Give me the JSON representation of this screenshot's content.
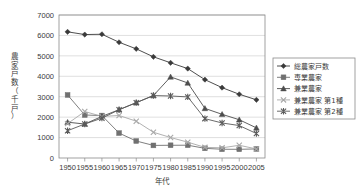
{
  "chart_data": {
    "type": "line",
    "title": "",
    "xlabel": "年代",
    "ylabel": "農家戸数（千戸）",
    "x": [
      1950,
      1955,
      1960,
      1965,
      1970,
      1975,
      1980,
      1985,
      1990,
      1995,
      2000,
      2005
    ],
    "xticklabels": [
      "1950",
      "1955",
      "1960",
      "1965",
      "1970",
      "1975",
      "1980",
      "1985",
      "1990",
      "1995",
      "2000",
      "2005"
    ],
    "yticklabels": [
      "0",
      "1000",
      "2000",
      "3000",
      "4000",
      "5000",
      "6000",
      "7000"
    ],
    "ylim": [
      0,
      7000
    ],
    "ytick_step": 1000,
    "grid": "horizontal",
    "legend_position": "right",
    "series": [
      {
        "name": "総農家戸数",
        "marker": "diamond",
        "color": "#3a3a3a",
        "values": [
          6176,
          6043,
          6057,
          5665,
          5342,
          4953,
          4661,
          4376,
          3835,
          3444,
          3120,
          2848
        ]
      },
      {
        "name": "専業農家",
        "marker": "square",
        "color": "#707070",
        "values": [
          3086,
          2105,
          2078,
          1219,
          831,
          616,
          623,
          626,
          473,
          428,
          426,
          443
        ]
      },
      {
        "name": "兼業農家",
        "marker": "triangle",
        "color": "#4d4d4d",
        "values": [
          1753,
          1663,
          2036,
          2365,
          2709,
          3057,
          3971,
          3674,
          2428,
          2139,
          1873,
          1475
        ]
      },
      {
        "name": "兼業農家 第1種",
        "marker": "cross",
        "color": "#a8a8a8",
        "values": [
          1683,
          2275,
          2036,
          2081,
          1802,
          1259,
          1002,
          775,
          521,
          498,
          623,
          443
        ]
      },
      {
        "name": "兼業農家 第2種",
        "marker": "star",
        "color": "#5a5a5a",
        "values": [
          1336,
          1663,
          1950,
          2365,
          2709,
          3057,
          3036,
          2990,
          1926,
          1715,
          1588,
          1198
        ]
      }
    ]
  },
  "legend": {
    "items": [
      {
        "label": "総農家戸数"
      },
      {
        "label": "専業農家"
      },
      {
        "label": "兼業農家"
      },
      {
        "label": "兼業農家 第1種"
      },
      {
        "label": "兼業農家 第2種"
      }
    ]
  }
}
